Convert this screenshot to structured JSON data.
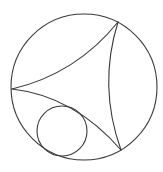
{
  "diagram": {
    "stroke_color": "#3a3a3a",
    "background": "#ffffff",
    "boundary_circle": {
      "cx": 84,
      "cy": 87,
      "r": 73
    },
    "ideal_vertices": [
      {
        "name": "left",
        "x": 12,
        "y": 89
      },
      {
        "name": "top-right",
        "x": 118,
        "y": 22
      },
      {
        "name": "bottom-right",
        "x": 121,
        "y": 150
      }
    ],
    "geodesic_arcs": [
      {
        "name": "upper-arc",
        "d": "M12,89 Q76,74 118,22"
      },
      {
        "name": "lower-arc",
        "d": "M12,89 Q74,96 121,150"
      },
      {
        "name": "right-arc",
        "d": "M118,22 Q98,86 121,150"
      }
    ],
    "small_circle": {
      "cx": 62,
      "cy": 131,
      "r": 25
    }
  }
}
